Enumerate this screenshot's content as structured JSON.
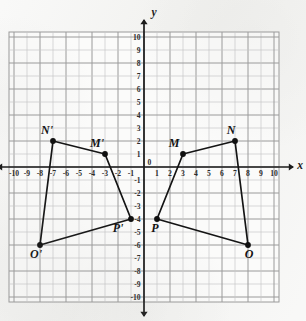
{
  "figure": {
    "axis_labels": {
      "x": "x",
      "y": "y"
    }
  },
  "chart_data": {
    "type": "scatter",
    "title": "",
    "xlabel": "x",
    "ylabel": "y",
    "xlim": [
      -10,
      10
    ],
    "ylim": [
      -10,
      10
    ],
    "grid": true,
    "legend": "none",
    "x_ticks": [
      -10,
      -9,
      -8,
      -7,
      -6,
      -5,
      -4,
      -3,
      -2,
      -1,
      0,
      1,
      2,
      3,
      4,
      5,
      6,
      7,
      8,
      9,
      10
    ],
    "y_ticks": [
      -10,
      -9,
      -8,
      -7,
      -6,
      -5,
      -4,
      -3,
      -2,
      -1,
      0,
      1,
      2,
      3,
      4,
      5,
      6,
      7,
      8,
      9,
      10
    ],
    "x_tick_labels": [
      "-10",
      "-9",
      "-8",
      "-7",
      "-6",
      "-5",
      "-4",
      "-3",
      "-2",
      "-1",
      "0",
      "1",
      "2",
      "3",
      "4",
      "5",
      "6",
      "7",
      "8",
      "9",
      "10"
    ],
    "y_tick_labels": [
      "-10",
      "-9",
      "-8",
      "-7",
      "-6",
      "-5",
      "-4",
      "-3",
      "-2",
      "-1",
      "0",
      "1",
      "2",
      "3",
      "4",
      "5",
      "6",
      "7",
      "8",
      "9",
      "10"
    ],
    "series": [
      {
        "name": "MNOP",
        "closed": true,
        "points": [
          {
            "label": "M",
            "x": 3,
            "y": 1,
            "label_dx": -9,
            "label_dy": -7
          },
          {
            "label": "N",
            "x": 7,
            "y": 2,
            "label_dx": -4,
            "label_dy": -7
          },
          {
            "label": "O",
            "x": 8,
            "y": -6,
            "label_dx": 1,
            "label_dy": 13
          },
          {
            "label": "P",
            "x": 1,
            "y": -4,
            "label_dx": -2,
            "label_dy": 13
          }
        ]
      },
      {
        "name": "M'N'O'P'",
        "closed": true,
        "points": [
          {
            "label": "M'",
            "x": -3,
            "y": 1,
            "label_dx": -8,
            "label_dy": -7
          },
          {
            "label": "N'",
            "x": -7,
            "y": 2,
            "label_dx": -6,
            "label_dy": -7
          },
          {
            "label": "O'",
            "x": -8,
            "y": -6,
            "label_dx": -4,
            "label_dy": 13
          },
          {
            "label": "P'",
            "x": -1,
            "y": -4,
            "label_dx": -13,
            "label_dy": 13
          }
        ]
      }
    ]
  },
  "tick_labels": {
    "x": [
      "-10",
      "-9",
      "-8",
      "-7",
      "-6",
      "-5",
      "-4",
      "-3",
      "-2",
      "-1",
      "0",
      "1",
      "2",
      "3",
      "4",
      "5",
      "6",
      "7",
      "8",
      "9",
      "10"
    ],
    "y_positive": [
      "1",
      "2",
      "3",
      "4",
      "5",
      "6",
      "7",
      "8",
      "9",
      "10"
    ],
    "y_negative": [
      "-1",
      "-2",
      "-3",
      "-4",
      "-5",
      "-6",
      "-7",
      "-8",
      "-9",
      "-10"
    ]
  },
  "colors": {
    "grid_minor": "#c8c8c8",
    "grid_major": "#9a9a9a",
    "axis": "#1b1b1b",
    "shape_stroke": "#141414",
    "vertex_fill": "#101010",
    "plot_background": "#fbfbfa",
    "page_background": "#f2f2f0"
  }
}
